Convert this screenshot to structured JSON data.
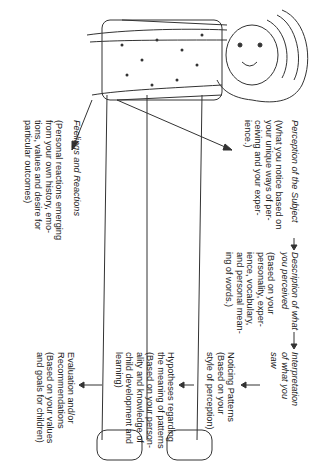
{
  "diagram": {
    "orientation": "rotated 90 degrees clockwise",
    "flow": [
      {
        "id": "perception",
        "title": "Perception of the Subject",
        "note": "(What you notice based on\nyour unique ways of per-\nceiving and your exper-\nience.)"
      },
      {
        "id": "description",
        "title": "Description of what\nyou perceived",
        "note": "(Based on your\npersonality, exper-\nience, vocabulary,\nand personal mean-\ning of words.)"
      },
      {
        "id": "interpretation",
        "title": "Interpretation\nof what you\nsaw"
      }
    ],
    "interpretation_steps": [
      {
        "id": "noticing",
        "text": "Noticing Patterns\n(Based on your\nstyle of perception)"
      },
      {
        "id": "hypotheses",
        "text": "Hypotheses regarding\nthe meaning of patterns\n(Based on your person-\nality and knowledge of\nchild development and\nlearning)"
      },
      {
        "id": "evaluation",
        "text": "Evaluation and/or\nRecommendations\n(Based on your values\nand goals for children)"
      }
    ],
    "feelings": {
      "title": "Feelings and Reactions",
      "note": "(Personal reactions emerging\nfrom your own history, emo-\ntions, values and desire for\nparticular outcomes)"
    },
    "illustration": "line drawing of a standing girl with long hair, patterned shirt and pants",
    "arrow_glyph": "→"
  }
}
